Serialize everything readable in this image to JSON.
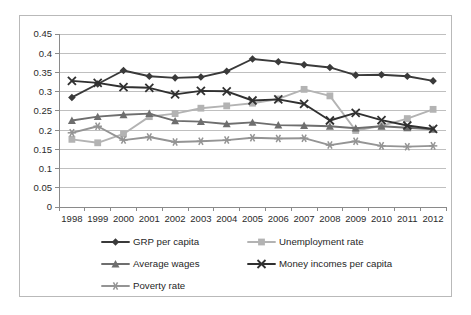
{
  "chart_data": {
    "type": "line",
    "title": "",
    "xlabel": "",
    "ylabel": "",
    "ylim": [
      0,
      0.45
    ],
    "ytick_step": 0.05,
    "grid": true,
    "legend_position": "bottom",
    "categories": [
      "1998",
      "1999",
      "2000",
      "2001",
      "2002",
      "2003",
      "2004",
      "2005",
      "2006",
      "2007",
      "2008",
      "2009",
      "2010",
      "2011",
      "2012"
    ],
    "ytick_labels": [
      "0",
      "0.05",
      "0.1",
      "0.15",
      "0.2",
      "0.25",
      "0.3",
      "0.35",
      "0.4",
      "0.45"
    ],
    "ytick_values": [
      0,
      0.05,
      0.1,
      0.15,
      0.2,
      0.25,
      0.3,
      0.35,
      0.4,
      0.45
    ],
    "series": [
      {
        "name": "GRP per capita",
        "marker": "diamond",
        "color": "#3a3a3a",
        "values": [
          0.285,
          0.32,
          0.355,
          0.34,
          0.336,
          0.338,
          0.353,
          0.385,
          0.378,
          0.37,
          0.363,
          0.343,
          0.344,
          0.34,
          0.328
        ]
      },
      {
        "name": "Unemployment rate",
        "marker": "square",
        "color": "#b3b3b3",
        "values": [
          0.176,
          0.167,
          0.19,
          0.235,
          0.243,
          0.257,
          0.263,
          0.27,
          0.281,
          0.306,
          0.289,
          0.199,
          0.211,
          0.23,
          0.254
        ]
      },
      {
        "name": "Average wages",
        "marker": "triangle",
        "color": "#6e6e6e",
        "values": [
          0.225,
          0.235,
          0.24,
          0.243,
          0.224,
          0.222,
          0.216,
          0.22,
          0.213,
          0.212,
          0.21,
          0.205,
          0.21,
          0.206,
          0.202
        ]
      },
      {
        "name": "Money incomes per capita",
        "marker": "cross",
        "color": "#303030",
        "values": [
          0.328,
          0.323,
          0.312,
          0.31,
          0.293,
          0.302,
          0.301,
          0.277,
          0.28,
          0.268,
          0.225,
          0.245,
          0.226,
          0.212,
          0.203
        ]
      },
      {
        "name": "Poverty rate",
        "marker": "asterisk",
        "color": "#949494",
        "values": [
          0.193,
          0.21,
          0.174,
          0.182,
          0.169,
          0.171,
          0.174,
          0.18,
          0.178,
          0.179,
          0.161,
          0.171,
          0.159,
          0.157,
          0.159
        ]
      }
    ]
  },
  "legend": {
    "entries": [
      {
        "label": "GRP per capita"
      },
      {
        "label": "Unemployment rate"
      },
      {
        "label": "Average wages"
      },
      {
        "label": "Money incomes per capita"
      },
      {
        "label": "Poverty rate"
      }
    ]
  }
}
